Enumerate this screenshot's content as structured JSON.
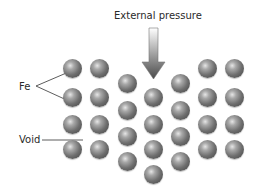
{
  "diagram": {
    "title": "External pressure",
    "labels": {
      "fe": "Fe",
      "void": "Void"
    },
    "arrow": {
      "direction": "down",
      "gradient_top": "#ffffff",
      "gradient_bottom": "#555555"
    },
    "sphere_color": "#6f6f6f",
    "spheres": [
      {
        "col": 1,
        "x": 72,
        "y": 68
      },
      {
        "col": 1,
        "x": 72,
        "y": 97
      },
      {
        "col": 1,
        "x": 72,
        "y": 124
      },
      {
        "col": 1,
        "x": 72,
        "y": 149
      },
      {
        "col": 2,
        "x": 99,
        "y": 68
      },
      {
        "col": 2,
        "x": 99,
        "y": 97
      },
      {
        "col": 2,
        "x": 99,
        "y": 124
      },
      {
        "col": 2,
        "x": 99,
        "y": 149
      },
      {
        "col": 3,
        "x": 127,
        "y": 83
      },
      {
        "col": 3,
        "x": 127,
        "y": 110
      },
      {
        "col": 3,
        "x": 127,
        "y": 136
      },
      {
        "col": 3,
        "x": 127,
        "y": 161
      },
      {
        "col": 4,
        "x": 153,
        "y": 97
      },
      {
        "col": 4,
        "x": 153,
        "y": 124
      },
      {
        "col": 4,
        "x": 153,
        "y": 149
      },
      {
        "col": 4,
        "x": 153,
        "y": 174
      },
      {
        "col": 5,
        "x": 180,
        "y": 83
      },
      {
        "col": 5,
        "x": 180,
        "y": 110
      },
      {
        "col": 5,
        "x": 180,
        "y": 136
      },
      {
        "col": 5,
        "x": 180,
        "y": 161
      },
      {
        "col": 6,
        "x": 207,
        "y": 68
      },
      {
        "col": 6,
        "x": 207,
        "y": 97
      },
      {
        "col": 6,
        "x": 207,
        "y": 124
      },
      {
        "col": 6,
        "x": 207,
        "y": 149
      },
      {
        "col": 7,
        "x": 234,
        "y": 68
      },
      {
        "col": 7,
        "x": 234,
        "y": 97
      },
      {
        "col": 7,
        "x": 234,
        "y": 124
      },
      {
        "col": 7,
        "x": 234,
        "y": 149
      }
    ]
  }
}
